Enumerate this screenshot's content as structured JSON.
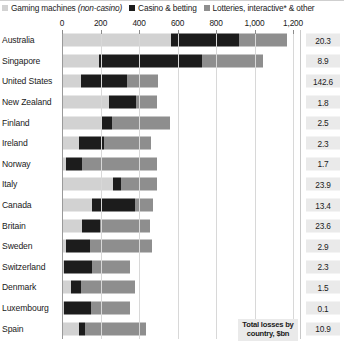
{
  "legend": {
    "items": [
      {
        "label": "Gaming machines",
        "label_italic": "(non-casino)",
        "color": "#d2d2d2",
        "icon": "square-swatch-icon"
      },
      {
        "label": "Casino & betting",
        "label_italic": "",
        "color": "#1c1c1c",
        "icon": "square-swatch-icon"
      },
      {
        "label": "Lotteries, interactive* & other",
        "label_italic": "",
        "color": "#8e8e8e",
        "icon": "square-swatch-icon"
      }
    ]
  },
  "annotation": {
    "total_note_line1": "Total losses by",
    "total_note_line2": "country, $bn"
  },
  "chart_data": {
    "type": "bar",
    "orientation": "horizontal",
    "stacked": true,
    "title": "",
    "subtitle": "",
    "xlabel": "",
    "ylabel": "",
    "xlim": [
      0,
      1200
    ],
    "xticks": [
      0,
      200,
      400,
      600,
      800,
      1000,
      1200
    ],
    "xtick_labels": [
      "0",
      "200",
      "400",
      "600",
      "800",
      "1,000",
      "1,200"
    ],
    "grid": true,
    "legend_position": "top",
    "categories": [
      "Australia",
      "Singapore",
      "United States",
      "New Zealand",
      "Finland",
      "Ireland",
      "Norway",
      "Italy",
      "Canada",
      "Britain",
      "Sweden",
      "Switzerland",
      "Denmark",
      "Luxembourg",
      "Spain"
    ],
    "series": [
      {
        "name": "Gaming machines (non-casino)",
        "color": "#d2d2d2",
        "values": [
          566,
          190,
          100,
          245,
          200,
          90,
          20,
          263,
          156,
          102,
          20,
          10,
          45,
          10,
          90
        ]
      },
      {
        "name": "Casino & betting",
        "color": "#1c1c1c",
        "values": [
          351,
          535,
          240,
          140,
          58,
          130,
          85,
          44,
          224,
          98,
          125,
          145,
          55,
          140,
          30
        ]
      },
      {
        "name": "Lotteries, interactive* & other",
        "color": "#8e8e8e",
        "values": [
          254,
          320,
          160,
          110,
          302,
          240,
          390,
          186,
          93,
          258,
          325,
          200,
          280,
          205,
          315
        ]
      }
    ],
    "totals_label": "Total losses by country, $bn",
    "totals": [
      20.3,
      8.9,
      142.6,
      1.8,
      2.5,
      2.3,
      1.7,
      23.9,
      13.4,
      23.6,
      2.9,
      2.3,
      1.5,
      0.1,
      10.9
    ]
  }
}
